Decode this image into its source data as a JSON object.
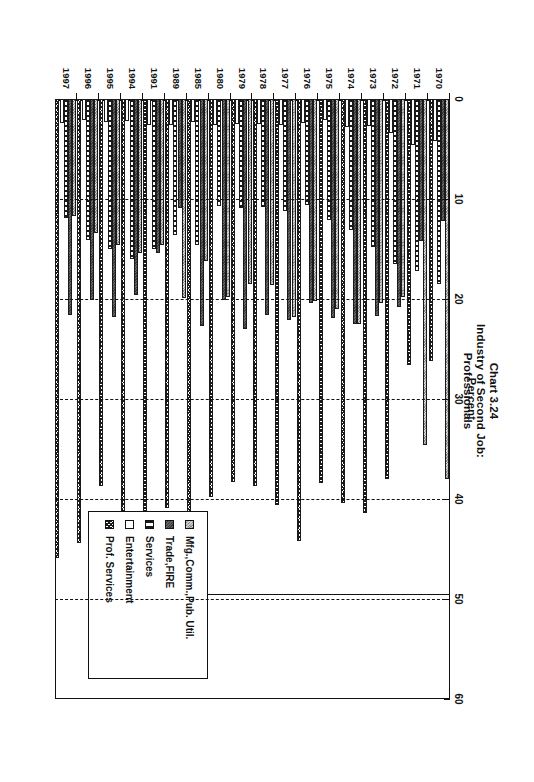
{
  "title": {
    "line1": "Chart 3.24",
    "line2": "Industry of Second Job:",
    "line3": "Professionals"
  },
  "axis": {
    "title": "Percent",
    "ticks": [
      "0",
      "10",
      "20",
      "30",
      "40",
      "50",
      "60"
    ]
  },
  "legend": {
    "items": [
      {
        "label": "Mfg.,Comm.,Pub. Util.",
        "pattern": "p-mfg"
      },
      {
        "label": "Trade,FIRE",
        "pattern": "p-trade"
      },
      {
        "label": "Services",
        "pattern": "p-serv"
      },
      {
        "label": "Entertainment",
        "pattern": "p-ent"
      },
      {
        "label": "Prof. Services",
        "pattern": "p-prof"
      }
    ]
  },
  "chart_data": {
    "type": "bar",
    "orientation": "horizontal",
    "title": "Chart 3.24 Industry of Second Job: Professionals",
    "xlabel": "Percent",
    "ylabel": "",
    "xlim": [
      0,
      60
    ],
    "xticks": [
      0,
      10,
      20,
      30,
      40,
      50,
      60
    ],
    "grid": true,
    "legend_position": "bottom-right",
    "categories": [
      "1970",
      "1971",
      "1972",
      "1973",
      "1974",
      "1975",
      "1976",
      "1977",
      "1978",
      "1979",
      "1980",
      "1985",
      "1989",
      "1991",
      "1994",
      "1995",
      "1996",
      "1997"
    ],
    "series": [
      {
        "name": "Mfg.,Comm.,Pub. Util.",
        "values": [
          38.0,
          34.6,
          19.8,
          20.4,
          22.5,
          21.0,
          20.2,
          21.8,
          18.6,
          18.5,
          19.8,
          16.2,
          19.9,
          14.6,
          15.4,
          14.6,
          13.4,
          11.7
        ]
      },
      {
        "name": "Trade,FIRE",
        "values": [
          12.2,
          14.2,
          20.8,
          21.7,
          22.5,
          21.9,
          20.4,
          22.1,
          21.6,
          23.0,
          20.1,
          22.7,
          10.9,
          15.4,
          19.6,
          21.8,
          20.1,
          21.6
        ]
      },
      {
        "name": "Services",
        "values": [
          18.5,
          17.2,
          16.5,
          14.8,
          13.1,
          12.1,
          10.6,
          11.2,
          10.8,
          10.9,
          10.7,
          14.6,
          13.6,
          15.0,
          16.0,
          15.0,
          14.1,
          11.9
        ]
      },
      {
        "name": "Entertainment",
        "values": [
          4.2,
          4.6,
          3.4,
          2.7,
          2.8,
          2.1,
          2.4,
          2.6,
          2.5,
          2.5,
          2.6,
          2.3,
          2.6,
          2.6,
          2.2,
          2.3,
          2.1,
          2.4
        ]
      },
      {
        "name": "Prof. Services",
        "values": [
          26.2,
          26.6,
          38.0,
          41.4,
          40.4,
          38.4,
          44.2,
          40.6,
          38.7,
          38.3,
          39.8,
          44.1,
          40.9,
          42.1,
          45.3,
          38.7,
          44.4,
          45.9
        ]
      }
    ]
  }
}
